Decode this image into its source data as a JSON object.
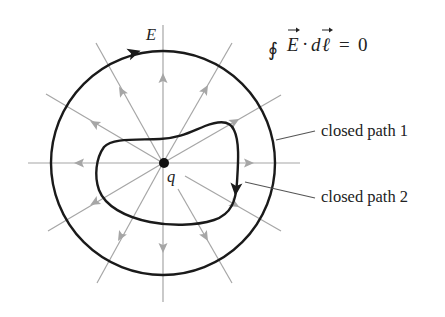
{
  "figure": {
    "field_label": "E",
    "charge_label": "q",
    "equation": {
      "integral_symbol": "∮",
      "lhs_vector_E": "E",
      "dot": "·",
      "d": "d",
      "ell": "ℓ",
      "equals": "=",
      "rhs": "0",
      "full_text": "∮E⃗·dℓ⃗ = 0"
    },
    "labels": {
      "path1": "closed path 1",
      "path2": "closed path 2"
    },
    "colors": {
      "field_lines": "#a6a6a6",
      "paths": "#1a1a1a",
      "charge": "#111111",
      "background": "#ffffff"
    },
    "geometry": {
      "center": [
        163,
        163
      ],
      "outer_circle_radius": 112,
      "field_line_count": 12,
      "field_line_angle_step_deg": 30
    }
  }
}
